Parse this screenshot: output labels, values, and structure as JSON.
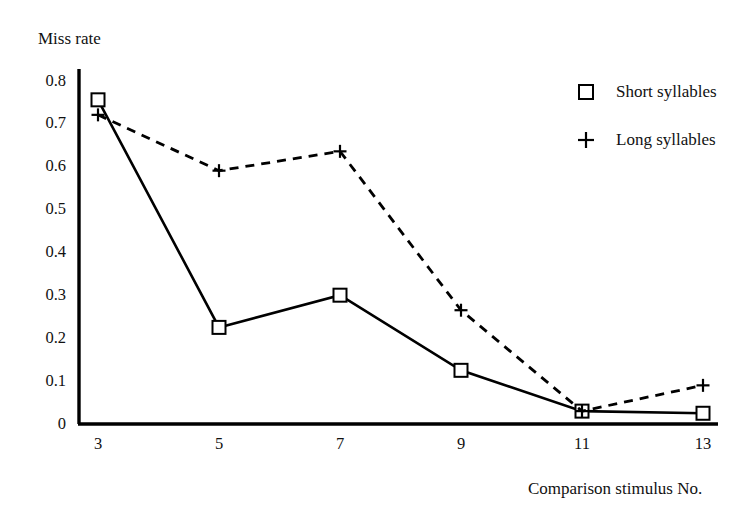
{
  "chart_data": {
    "type": "line",
    "title": "",
    "xlabel": "Comparison stimulus No.",
    "ylabel": "Miss rate",
    "categories": [
      3,
      5,
      7,
      9,
      11,
      13
    ],
    "x_tick_labels": [
      "3",
      "5",
      "7",
      "9",
      "11",
      "13"
    ],
    "y_tick_labels": [
      "0",
      "0.1",
      "0.2",
      "0.3",
      "0.4",
      "0.5",
      "0.6",
      "0.7",
      "0.8"
    ],
    "y_tick_values": [
      0,
      0.1,
      0.2,
      0.3,
      0.4,
      0.5,
      0.6,
      0.7,
      0.8
    ],
    "ylim": [
      0,
      0.8
    ],
    "grid": false,
    "legend_position": "top-right",
    "series": [
      {
        "name": "Short syllables",
        "marker": "square",
        "linestyle": "solid",
        "color": "#000000",
        "values": [
          0.755,
          0.225,
          0.3,
          0.125,
          0.03,
          0.025
        ]
      },
      {
        "name": "Long syllables",
        "marker": "plus",
        "linestyle": "dashed",
        "color": "#000000",
        "values": [
          0.72,
          0.59,
          0.635,
          0.265,
          0.03,
          0.09
        ]
      }
    ]
  },
  "legend": {
    "items": [
      {
        "label": "Short syllables",
        "marker": "square"
      },
      {
        "label": "Long syllables",
        "marker": "plus"
      }
    ]
  }
}
